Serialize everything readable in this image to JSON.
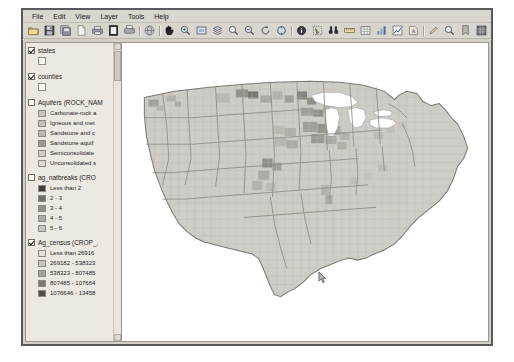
{
  "window": {
    "menu": [
      {
        "label": "File"
      },
      {
        "label": "Edit"
      },
      {
        "label": "View"
      },
      {
        "label": "Layer"
      },
      {
        "label": "Tools"
      },
      {
        "label": "Help"
      }
    ],
    "toolbar": [
      {
        "icon": "open-folder-icon",
        "name": "open-project-button"
      },
      {
        "icon": "save-icon",
        "name": "save-project-button"
      },
      {
        "icon": "save-as-icon",
        "name": "save-project-as-button"
      },
      {
        "icon": "new-icon",
        "name": "new-project-button"
      },
      {
        "icon": "print-icon",
        "name": "print-button"
      },
      {
        "icon": "page-icon",
        "name": "page-composer-button"
      },
      {
        "icon": "printer-icon",
        "name": "print-preview-button"
      },
      {
        "sep": true
      },
      {
        "icon": "globe-icon",
        "name": "add-vector-layer-button"
      },
      {
        "sep": true
      },
      {
        "icon": "pan-hand-icon",
        "name": "pan-map-button"
      },
      {
        "icon": "zoom-in-icon",
        "name": "zoom-in-button"
      },
      {
        "icon": "zoom-full-icon",
        "name": "zoom-full-extent-button"
      },
      {
        "icon": "zoom-layer-icon",
        "name": "zoom-to-layer-button"
      },
      {
        "icon": "zoom-selection-icon",
        "name": "zoom-to-selection-button"
      },
      {
        "icon": "zoom-out-icon",
        "name": "zoom-out-button"
      },
      {
        "icon": "zoom-last-icon",
        "name": "zoom-last-button"
      },
      {
        "icon": "refresh-icon",
        "name": "refresh-map-button"
      },
      {
        "sep": true
      },
      {
        "icon": "identify-icon",
        "name": "identify-features-button"
      },
      {
        "icon": "select-features-icon",
        "name": "select-features-button"
      },
      {
        "icon": "binoculars-icon",
        "name": "search-features-button"
      },
      {
        "icon": "measure-icon",
        "name": "measure-line-button"
      },
      {
        "icon": "attribute-table-icon",
        "name": "open-attribute-table-button"
      },
      {
        "icon": "statistics-icon",
        "name": "show-statistics-button"
      },
      {
        "icon": "chart-icon",
        "name": "show-chart-button"
      },
      {
        "icon": "label-icon",
        "name": "labeling-button"
      },
      {
        "sep": true
      },
      {
        "icon": "pencil-icon",
        "name": "toggle-editing-button"
      },
      {
        "icon": "magnifier-icon",
        "name": "map-tips-button"
      },
      {
        "icon": "bookmark-icon",
        "name": "bookmarks-button"
      },
      {
        "icon": "grid-icon",
        "name": "layer-properties-button"
      }
    ]
  },
  "legend": {
    "panel_title": "Layers",
    "layers": [
      {
        "name": "states",
        "label": "states",
        "checked": true,
        "has_blank_symbol": true,
        "symbols": []
      },
      {
        "name": "counties",
        "label": "counties",
        "checked": true,
        "has_blank_symbol": true,
        "symbols": []
      },
      {
        "name": "aquifers",
        "label": "Aquifers (ROCK_NAM",
        "checked": false,
        "has_blank_symbol": false,
        "symbols": [
          {
            "label": "Carbonate-rock a",
            "color": "#c9c6bf"
          },
          {
            "label": "Igneous and met",
            "color": "#c4c1b9"
          },
          {
            "label": "Sandstone and c",
            "color": "#bdbab2"
          },
          {
            "label": "Sandstone aquif",
            "color": "#9d9a93"
          },
          {
            "label": "Semiconsolidate",
            "color": "#d0cdc6"
          },
          {
            "label": "Unconsolidated s",
            "color": "#dbd8d1"
          }
        ]
      },
      {
        "name": "ag-natbreaks",
        "label": "ag_natbreaks (CRO",
        "checked": false,
        "has_blank_symbol": false,
        "symbols": [
          {
            "label": "Less than 2",
            "color": "#3c3c3c"
          },
          {
            "label": "2 - 3",
            "color": "#6e6e6e"
          },
          {
            "label": "3 - 4",
            "color": "#8f8f8f"
          },
          {
            "label": "4 - 5",
            "color": "#ababab"
          },
          {
            "label": "5 - 6",
            "color": "#c6c6c6"
          }
        ]
      },
      {
        "name": "ag-census",
        "label": "Ag_census (CROP_,",
        "checked": true,
        "has_blank_symbol": false,
        "symbols": [
          {
            "label": "Less than 26916",
            "color": "#e2e0db"
          },
          {
            "label": "269182 - 538323",
            "color": "#c6c4bf"
          },
          {
            "label": "538323 - 807485",
            "color": "#a3a19c"
          },
          {
            "label": "807485 - 107664",
            "color": "#7b7975"
          },
          {
            "label": "1076646 - 13458",
            "color": "#4f4d4a"
          }
        ]
      }
    ]
  },
  "map": {
    "name": "united-states-county-choropleth",
    "background": "#ffffff",
    "state_fill": "#cfcdc7",
    "state_stroke": "#8f8d87",
    "county_stroke": "#bdbbb5"
  },
  "colors": {
    "window_face": "#d4d0c8",
    "panel_face": "#ece9e2",
    "frame_border": "#5a5a5a",
    "text": "#1c1c18"
  }
}
